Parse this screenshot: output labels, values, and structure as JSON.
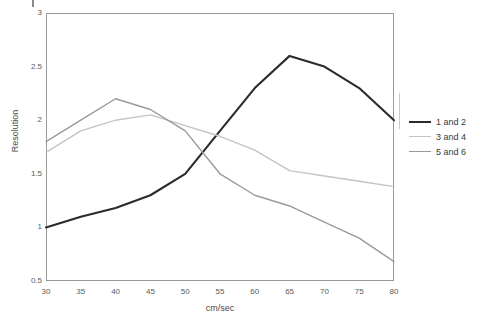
{
  "chart_data": {
    "type": "line",
    "title": "",
    "xlabel": "cm/sec",
    "ylabel": "Resolution",
    "x": [
      30,
      35,
      40,
      45,
      50,
      55,
      60,
      65,
      70,
      75,
      80
    ],
    "xtick_labels": [
      "30",
      "35",
      "40",
      "45",
      "50",
      "55",
      "60",
      "65",
      "70",
      "75",
      "80"
    ],
    "ytick_labels": [
      "0.5",
      "1",
      "1.5",
      "2",
      "2.5",
      "3"
    ],
    "yticks": [
      0.5,
      1,
      1.5,
      2,
      2.5,
      3
    ],
    "xlim": [
      30,
      80
    ],
    "ylim": [
      0.5,
      3
    ],
    "grid": false,
    "legend_position": "right",
    "series": [
      {
        "name": "1 and 2",
        "color": "#2b2b2b",
        "width": 2.1,
        "values": [
          1.0,
          1.1,
          1.18,
          1.3,
          1.5,
          1.9,
          2.3,
          2.6,
          2.5,
          2.3,
          2.0
        ]
      },
      {
        "name": "3 and 4",
        "color": "#c4c4c4",
        "width": 1.4,
        "values": [
          1.7,
          1.9,
          2.0,
          2.05,
          1.95,
          1.85,
          1.72,
          1.53,
          1.48,
          1.43,
          1.38
        ]
      },
      {
        "name": "5 and 6",
        "color": "#9a9a9a",
        "width": 1.4,
        "values": [
          1.8,
          2.0,
          2.2,
          2.1,
          1.9,
          1.5,
          1.3,
          1.2,
          1.05,
          0.9,
          0.68
        ]
      }
    ]
  },
  "axes": {
    "x_title": "cm/sec",
    "y_title": "Resolution"
  },
  "legend": {
    "items": [
      {
        "label": "1 and 2"
      },
      {
        "label": "3 and 4"
      },
      {
        "label": "5 and 6"
      }
    ]
  }
}
